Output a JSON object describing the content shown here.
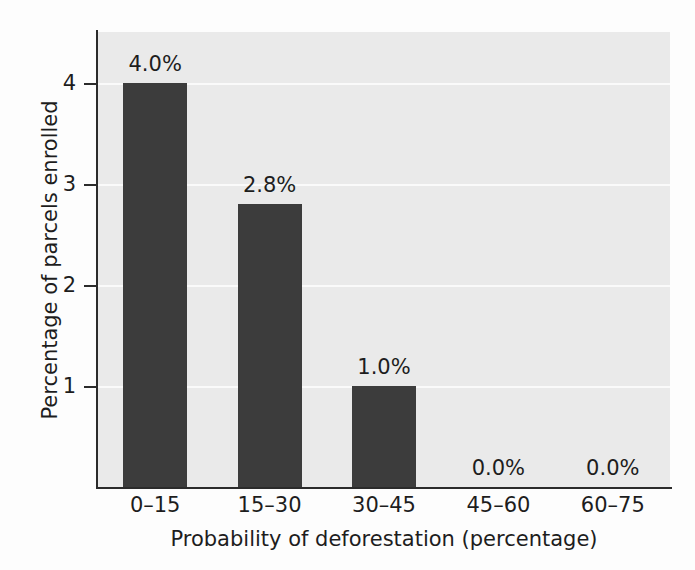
{
  "chart_data": {
    "type": "bar",
    "title": "",
    "xlabel": "Probability of deforestation (percentage)",
    "ylabel": "Percentage of parcels enrolled",
    "categories": [
      "0–15",
      "15–30",
      "30–45",
      "45–60",
      "60–75"
    ],
    "values": [
      4.0,
      2.8,
      1.0,
      0.0,
      0.0
    ],
    "data_labels": [
      "4.0%",
      "2.8%",
      "1.0%",
      "0.0%",
      "0.0%"
    ],
    "ylim": [
      0,
      4.5
    ],
    "y_ticks": [
      1,
      2,
      3,
      4
    ],
    "y_tick_labels": [
      "1",
      "2",
      "3",
      "4"
    ],
    "grid": true,
    "grid_axis": "y",
    "legend": "none",
    "bar_color": "#3c3c3c",
    "plot_background": "#eaeaea",
    "gridline_color": "#fafafa",
    "axis_color": "#2b2b2b",
    "text_color": "#1d1d1d",
    "figure_background": "#fdfdfd"
  }
}
